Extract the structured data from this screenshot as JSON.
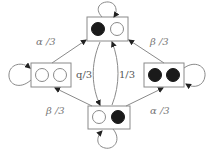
{
  "diagram": {
    "type": "state-transition",
    "colors": {
      "line": "#8a8a8a",
      "box": "#8a8a8a",
      "filled": "#1a1a1a",
      "empty": "#ffffff",
      "label": "#555555"
    },
    "states": [
      {
        "id": "top",
        "left": "filled",
        "right": "empty"
      },
      {
        "id": "left",
        "left": "empty",
        "right": "empty"
      },
      {
        "id": "right",
        "left": "filled",
        "right": "filled"
      },
      {
        "id": "bottom",
        "left": "empty",
        "right": "filled"
      }
    ],
    "edges": [
      {
        "from": "left",
        "to": "top",
        "label": "α /3"
      },
      {
        "from": "right",
        "to": "top",
        "label": "β /3"
      },
      {
        "from": "bottom",
        "to": "left",
        "label": "β /3"
      },
      {
        "from": "bottom",
        "to": "right",
        "label": "α /3"
      },
      {
        "from": "top",
        "to": "bottom",
        "label": "1/3",
        "bidirectional": true
      },
      {
        "from": "left",
        "to": "left",
        "label": "q/3",
        "self_loop": true
      },
      {
        "from": "top",
        "to": "top",
        "self_loop": true
      },
      {
        "from": "right",
        "to": "right",
        "self_loop": true
      },
      {
        "from": "bottom",
        "to": "bottom",
        "self_loop": true
      }
    ],
    "labels": {
      "left_to_top": "α /3",
      "right_to_top": "β /3",
      "bottom_to_left": "β /3",
      "bottom_to_right": "α /3",
      "left_self": "q/3",
      "vertical": "1/3"
    }
  }
}
